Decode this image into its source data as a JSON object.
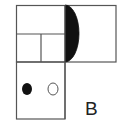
{
  "figure": {
    "label": "B",
    "stroke_color": "#555555",
    "fill_dark": "#111111",
    "background": "#ffffff",
    "shapes": {
      "top_rectangle": {
        "x": 16,
        "y": 5,
        "width": 100,
        "height": 57
      },
      "left_top_split_horizontal": {
        "y": 34,
        "x1": 16,
        "x2": 65
      },
      "left_bottom_split_vertical": {
        "x": 41,
        "y1": 34,
        "y2": 62
      },
      "center_divider": {
        "x": 65,
        "y1": 5,
        "y2": 119
      },
      "bottom_box": {
        "x": 16,
        "y": 62,
        "width": 49,
        "height": 57
      },
      "half_ellipse": {
        "x": 65,
        "y_top": 5,
        "y_bottom": 62,
        "bulge_right": 14,
        "fill": "black"
      },
      "filled_circle": {
        "cx": 27,
        "cy": 89,
        "r": 5,
        "fill": "black"
      },
      "hollow_circle": {
        "cx": 53,
        "cy": 89,
        "r": 5,
        "fill": "white"
      }
    }
  }
}
